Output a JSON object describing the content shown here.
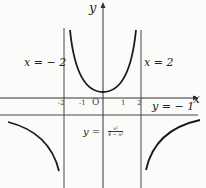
{
  "axes": {
    "x_label": "x",
    "y_label": "y",
    "origin_label": "O"
  },
  "ticks": {
    "x": [
      "-2",
      "-1",
      "1",
      "2"
    ]
  },
  "asymptotes": {
    "left": "x = − 2",
    "right": "x = 2",
    "horizontal": "y = − 1"
  },
  "function": {
    "lhs": "y =",
    "numerator": "x²",
    "denominator": "4 − x²"
  },
  "colors": {
    "curve": "#1a1a1a",
    "axis": "#333333"
  }
}
